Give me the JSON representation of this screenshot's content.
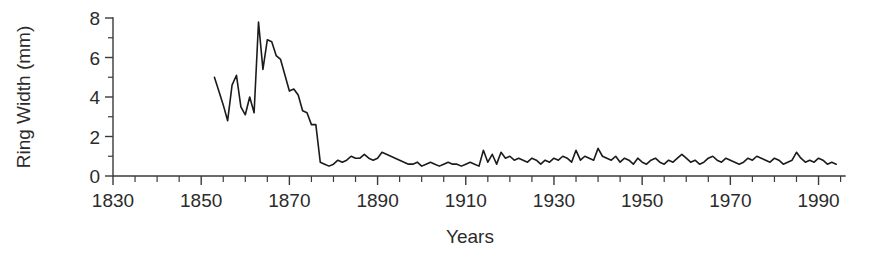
{
  "chart_data": {
    "type": "line",
    "title": "",
    "xlabel": "Years",
    "ylabel": "Ring Width (mm)",
    "xlim": [
      1830,
      1996
    ],
    "ylim": [
      0,
      8
    ],
    "grid": false,
    "legend": "none",
    "x_major_ticks": [
      1830,
      1850,
      1870,
      1890,
      1910,
      1930,
      1950,
      1970,
      1990
    ],
    "x_major_tick_labels": [
      "1830",
      "1850",
      "1870",
      "1890",
      "1910",
      "1930",
      "1950",
      "1970",
      "1990"
    ],
    "x_minor_tick_step": 5,
    "y_major_ticks": [
      0,
      2,
      4,
      6,
      8
    ],
    "y_major_tick_labels": [
      "0",
      "2",
      "4",
      "6",
      "8"
    ],
    "y_minor_tick_step": 1,
    "line_color": "#1b1b1b",
    "axis_color": "#3a3a3a",
    "series": [
      {
        "name": "Ring Width",
        "x": [
          1853,
          1854,
          1855,
          1856,
          1857,
          1858,
          1859,
          1860,
          1861,
          1862,
          1863,
          1864,
          1865,
          1866,
          1867,
          1868,
          1869,
          1870,
          1871,
          1872,
          1873,
          1874,
          1875,
          1876,
          1877,
          1878,
          1879,
          1880,
          1881,
          1882,
          1883,
          1884,
          1885,
          1886,
          1887,
          1888,
          1889,
          1890,
          1891,
          1892,
          1893,
          1894,
          1895,
          1896,
          1897,
          1898,
          1899,
          1900,
          1901,
          1902,
          1903,
          1904,
          1905,
          1906,
          1907,
          1908,
          1909,
          1910,
          1911,
          1912,
          1913,
          1914,
          1915,
          1916,
          1917,
          1918,
          1919,
          1920,
          1921,
          1922,
          1923,
          1924,
          1925,
          1926,
          1927,
          1928,
          1929,
          1930,
          1931,
          1932,
          1933,
          1934,
          1935,
          1936,
          1937,
          1938,
          1939,
          1940,
          1941,
          1942,
          1943,
          1944,
          1945,
          1946,
          1947,
          1948,
          1949,
          1950,
          1951,
          1952,
          1953,
          1954,
          1955,
          1956,
          1957,
          1958,
          1959,
          1960,
          1961,
          1962,
          1963,
          1964,
          1965,
          1966,
          1967,
          1968,
          1969,
          1970,
          1971,
          1972,
          1973,
          1974,
          1975,
          1976,
          1977,
          1978,
          1979,
          1980,
          1981,
          1982,
          1983,
          1984,
          1985,
          1986,
          1987,
          1988,
          1989,
          1990,
          1991,
          1992,
          1993,
          1994
        ],
        "values": [
          5.0,
          4.3,
          3.6,
          2.8,
          4.6,
          5.1,
          3.5,
          3.1,
          4.0,
          3.2,
          7.8,
          5.4,
          6.9,
          6.8,
          6.1,
          5.9,
          5.1,
          4.3,
          4.4,
          4.1,
          3.3,
          3.2,
          2.6,
          2.6,
          0.7,
          0.6,
          0.5,
          0.6,
          0.8,
          0.7,
          0.8,
          1.0,
          0.9,
          0.9,
          1.1,
          0.9,
          0.8,
          0.9,
          1.2,
          1.1,
          1.0,
          0.9,
          0.8,
          0.7,
          0.6,
          0.6,
          0.7,
          0.5,
          0.6,
          0.7,
          0.6,
          0.5,
          0.6,
          0.7,
          0.6,
          0.6,
          0.5,
          0.6,
          0.7,
          0.6,
          0.5,
          1.3,
          0.7,
          1.1,
          0.6,
          1.2,
          0.9,
          1.0,
          0.8,
          0.9,
          0.8,
          0.7,
          0.9,
          0.8,
          0.6,
          0.8,
          0.7,
          0.9,
          0.8,
          1.0,
          0.9,
          0.7,
          1.3,
          0.8,
          1.0,
          0.9,
          0.8,
          1.4,
          1.0,
          0.9,
          0.8,
          1.0,
          0.7,
          0.9,
          0.8,
          0.6,
          0.9,
          0.7,
          0.6,
          0.8,
          0.9,
          0.7,
          0.6,
          0.8,
          0.7,
          0.9,
          1.1,
          0.9,
          0.7,
          0.8,
          0.6,
          0.7,
          0.9,
          1.0,
          0.8,
          0.7,
          0.9,
          0.8,
          0.7,
          0.6,
          0.7,
          0.9,
          0.8,
          1.0,
          0.9,
          0.8,
          0.7,
          0.9,
          0.8,
          0.6,
          0.7,
          0.8,
          1.2,
          0.9,
          0.7,
          0.8,
          0.7,
          0.9,
          0.8,
          0.6,
          0.7,
          0.6
        ]
      }
    ]
  }
}
